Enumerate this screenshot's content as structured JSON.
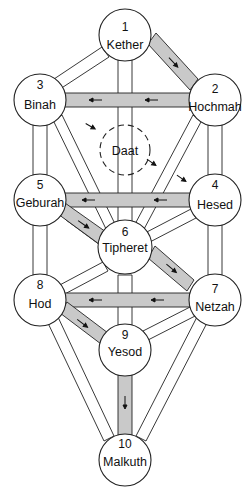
{
  "diagram": {
    "colors": {
      "line": "#222222",
      "shaded_path": "#c9c9c9",
      "node_fill": "#ffffff"
    },
    "nodes": [
      {
        "id": 1,
        "number": "1",
        "name": "Kether",
        "x": 125,
        "y": 35
      },
      {
        "id": 2,
        "number": "2",
        "name": "Hochmah",
        "x": 215,
        "y": 100
      },
      {
        "id": 3,
        "number": "3",
        "name": "Binah",
        "x": 40,
        "y": 100
      },
      {
        "id": 4,
        "number": "4",
        "name": "Hesed",
        "x": 215,
        "y": 200
      },
      {
        "id": 5,
        "number": "5",
        "name": "Geburah",
        "x": 40,
        "y": 200
      },
      {
        "id": 6,
        "number": "6",
        "name": "Tipheret",
        "x": 125,
        "y": 250
      },
      {
        "id": 7,
        "number": "7",
        "name": "Netzah",
        "x": 215,
        "y": 300
      },
      {
        "id": 8,
        "number": "8",
        "name": "Hod",
        "x": 40,
        "y": 300
      },
      {
        "id": 9,
        "number": "9",
        "name": "Yesod",
        "x": 125,
        "y": 350
      },
      {
        "id": 10,
        "number": "10",
        "name": "Malkuth",
        "x": 125,
        "y": 460
      }
    ],
    "hidden_node": {
      "name": "Daat",
      "x": 125,
      "y": 150,
      "style": "dashed"
    },
    "shaded_paths_with_flow": [
      {
        "from": "Kether",
        "to": "Hochmah"
      },
      {
        "from": "Hochmah",
        "to": "Binah"
      },
      {
        "from": "Binah",
        "to": "Daat"
      },
      {
        "from": "Daat",
        "to": "Hesed"
      },
      {
        "from": "Hesed",
        "to": "Geburah"
      },
      {
        "from": "Geburah",
        "to": "Tipheret"
      },
      {
        "from": "Tipheret",
        "to": "Netzah"
      },
      {
        "from": "Netzah",
        "to": "Hod"
      },
      {
        "from": "Hod",
        "to": "Yesod"
      },
      {
        "from": "Yesod",
        "to": "Malkuth"
      }
    ]
  }
}
